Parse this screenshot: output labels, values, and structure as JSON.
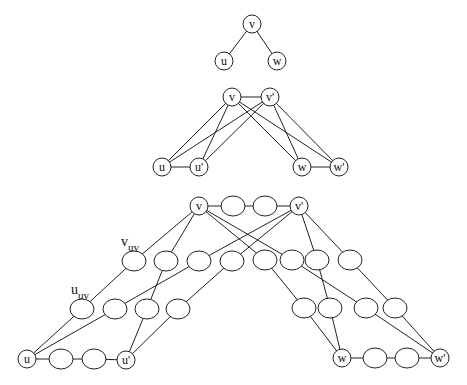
{
  "diagram": {
    "type": "graph-construction",
    "stages": [
      {
        "name": "original",
        "nodes": [
          {
            "id": "v",
            "label": "v",
            "x": 252,
            "y": 24
          },
          {
            "id": "u",
            "label": "u",
            "x": 224,
            "y": 61
          },
          {
            "id": "w",
            "label": "w",
            "x": 277,
            "y": 61
          }
        ],
        "edges": [
          [
            "v",
            "u"
          ],
          [
            "v",
            "w"
          ]
        ]
      },
      {
        "name": "doubled",
        "nodes": [
          {
            "id": "v",
            "label": "v",
            "x": 232,
            "y": 97
          },
          {
            "id": "v2",
            "label": "v'",
            "x": 270,
            "y": 97
          },
          {
            "id": "u",
            "label": "u",
            "x": 162,
            "y": 167
          },
          {
            "id": "u2",
            "label": "u'",
            "x": 199,
            "y": 167
          },
          {
            "id": "w",
            "label": "w",
            "x": 302,
            "y": 167
          },
          {
            "id": "w2",
            "label": "w'",
            "x": 339,
            "y": 167
          }
        ],
        "edges": [
          [
            "v",
            "v2"
          ],
          [
            "u",
            "u2"
          ],
          [
            "w",
            "w2"
          ],
          [
            "v",
            "u"
          ],
          [
            "v",
            "u2"
          ],
          [
            "v2",
            "u"
          ],
          [
            "v2",
            "u2"
          ],
          [
            "v",
            "w"
          ],
          [
            "v",
            "w2"
          ],
          [
            "v2",
            "w"
          ],
          [
            "v2",
            "w2"
          ]
        ]
      },
      {
        "name": "subdivided",
        "nodes": [
          {
            "id": "v",
            "label": "v",
            "x": 199,
            "y": 206
          },
          {
            "id": "a1",
            "label": "",
            "x": 233,
            "y": 206
          },
          {
            "id": "a2",
            "label": "",
            "x": 265,
            "y": 206
          },
          {
            "id": "v2",
            "label": "v'",
            "x": 299,
            "y": 206
          },
          {
            "id": "r1",
            "label": "",
            "x": 134,
            "y": 261
          },
          {
            "id": "r2",
            "label": "",
            "x": 166,
            "y": 261
          },
          {
            "id": "r3",
            "label": "",
            "x": 199,
            "y": 261
          },
          {
            "id": "r4",
            "label": "",
            "x": 232,
            "y": 261
          },
          {
            "id": "r5",
            "label": "",
            "x": 265,
            "y": 260
          },
          {
            "id": "r6",
            "label": "",
            "x": 292,
            "y": 260
          },
          {
            "id": "r7",
            "label": "",
            "x": 317,
            "y": 260
          },
          {
            "id": "r8",
            "label": "",
            "x": 350,
            "y": 260
          },
          {
            "id": "s1",
            "label": "",
            "x": 82,
            "y": 309
          },
          {
            "id": "s2",
            "label": "",
            "x": 115,
            "y": 309
          },
          {
            "id": "s3",
            "label": "",
            "x": 147,
            "y": 309
          },
          {
            "id": "s4",
            "label": "",
            "x": 178,
            "y": 309
          },
          {
            "id": "s5",
            "label": "",
            "x": 304,
            "y": 308
          },
          {
            "id": "s6",
            "label": "",
            "x": 330,
            "y": 308
          },
          {
            "id": "s7",
            "label": "",
            "x": 366,
            "y": 308
          },
          {
            "id": "s8",
            "label": "",
            "x": 395,
            "y": 308
          },
          {
            "id": "u",
            "label": "u",
            "x": 27,
            "y": 359
          },
          {
            "id": "b1",
            "label": "",
            "x": 61,
            "y": 359
          },
          {
            "id": "b2",
            "label": "",
            "x": 94,
            "y": 359
          },
          {
            "id": "u2",
            "label": "u'",
            "x": 126,
            "y": 360
          },
          {
            "id": "w",
            "label": "w",
            "x": 342,
            "y": 358
          },
          {
            "id": "c1",
            "label": "",
            "x": 375,
            "y": 358
          },
          {
            "id": "c2",
            "label": "",
            "x": 407,
            "y": 358
          },
          {
            "id": "w2",
            "label": "w'",
            "x": 440,
            "y": 358
          }
        ],
        "edges": [
          [
            "v",
            "a1"
          ],
          [
            "a1",
            "a2"
          ],
          [
            "a2",
            "v2"
          ],
          [
            "u",
            "b1"
          ],
          [
            "b1",
            "b2"
          ],
          [
            "b2",
            "u2"
          ],
          [
            "w",
            "c1"
          ],
          [
            "c1",
            "c2"
          ],
          [
            "c2",
            "w2"
          ],
          [
            "v",
            "r1"
          ],
          [
            "r1",
            "s1"
          ],
          [
            "s1",
            "u"
          ],
          [
            "v",
            "r2"
          ],
          [
            "r2",
            "s3"
          ],
          [
            "s3",
            "u2"
          ],
          [
            "v2",
            "r3"
          ],
          [
            "r3",
            "s2"
          ],
          [
            "s2",
            "u"
          ],
          [
            "v2",
            "r4"
          ],
          [
            "r4",
            "s4"
          ],
          [
            "s4",
            "u2"
          ],
          [
            "v",
            "r5"
          ],
          [
            "r5",
            "s5"
          ],
          [
            "s5",
            "w"
          ],
          [
            "v",
            "r6"
          ],
          [
            "r6",
            "s7"
          ],
          [
            "s7",
            "w2"
          ],
          [
            "v2",
            "r7"
          ],
          [
            "r7",
            "s6"
          ],
          [
            "s6",
            "w"
          ],
          [
            "v2",
            "r8"
          ],
          [
            "r8",
            "s8"
          ],
          [
            "s8",
            "w2"
          ]
        ],
        "annotations": [
          {
            "base": "v",
            "sub": "uv",
            "x": 121,
            "y": 246
          },
          {
            "base": "u",
            "sub": "uv",
            "x": 71,
            "y": 294
          }
        ]
      }
    ],
    "small_radius": 8,
    "chain_rx": 12,
    "chain_ry": 10
  }
}
